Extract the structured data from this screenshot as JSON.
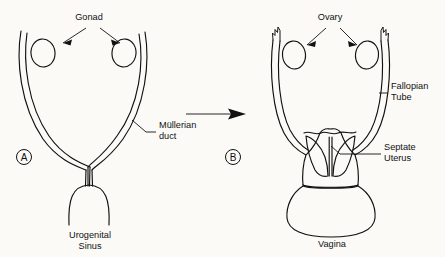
{
  "figure": {
    "background_color": "#fbfaf7",
    "ink_color": "#111111"
  },
  "panels": [
    {
      "id": "A",
      "badge_label": "A",
      "badge_x": 24,
      "badge_y": 157,
      "labels": [
        {
          "name": "gonad",
          "text": "Gonad",
          "x": 89,
          "y": 20
        },
        {
          "name": "mullerian-duct-line1",
          "text": "Müllerian",
          "x": 159,
          "y": 128
        },
        {
          "name": "mullerian-duct-line2",
          "text": "duct",
          "x": 159,
          "y": 139
        },
        {
          "name": "urogenital-sinus-line1",
          "text": "Urogenital",
          "x": 90,
          "y": 238
        },
        {
          "name": "urogenital-sinus-line2",
          "text": "Sinus",
          "x": 90,
          "y": 249
        }
      ]
    },
    {
      "id": "B",
      "badge_label": "B",
      "badge_y": 157,
      "badge_x": 233,
      "labels": [
        {
          "name": "ovary",
          "text": "Ovary",
          "x": 330,
          "y": 20
        },
        {
          "name": "fallopian-tube-line1",
          "text": "Fallopian",
          "x": 391,
          "y": 89
        },
        {
          "name": "fallopian-tube-line2",
          "text": "Tube",
          "x": 391,
          "y": 100
        },
        {
          "name": "septate-uterus-line1",
          "text": "Septate",
          "x": 384,
          "y": 150
        },
        {
          "name": "septate-uterus-line2",
          "text": "Uterus",
          "x": 384,
          "y": 161
        },
        {
          "name": "vagina",
          "text": "Vagina",
          "x": 332,
          "y": 247
        }
      ]
    }
  ],
  "transition_arrow": {
    "name": "transition-arrow",
    "x1": 186,
    "x2": 246,
    "y": 114
  },
  "anatomy_structures": [
    "left-mullerian-duct",
    "right-mullerian-duct",
    "left-gonad",
    "right-gonad",
    "urogenital-sinus",
    "left-fallopian-tube",
    "right-fallopian-tube",
    "left-fimbria",
    "right-fimbria",
    "left-ovary",
    "right-ovary",
    "uterus-body",
    "uterine-septum",
    "left-uterine-cavity",
    "right-uterine-cavity",
    "vagina"
  ]
}
